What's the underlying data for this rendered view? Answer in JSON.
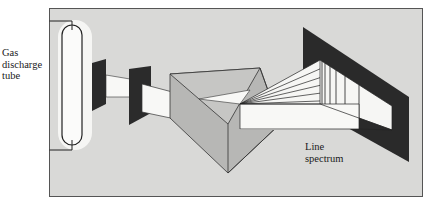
{
  "diagram": {
    "labels": {
      "tube": [
        "Gas",
        "discharge",
        "tube"
      ],
      "spectrum": [
        "Line",
        "spectrum"
      ]
    },
    "components": [
      {
        "id": "gas-discharge-tube",
        "label": "Gas discharge tube"
      },
      {
        "id": "slit-1",
        "label": ""
      },
      {
        "id": "slit-2",
        "label": ""
      },
      {
        "id": "prism",
        "label": ""
      },
      {
        "id": "screen",
        "label": ""
      },
      {
        "id": "line-spectrum",
        "label": "Line spectrum"
      }
    ],
    "colors": {
      "background": "#d9d9d7",
      "frame": "#555555",
      "slit": "#2b2b2b",
      "prism_face": "#b3b3b1",
      "prism_top": "#c4c4c2",
      "beam": "#f8f8f6",
      "screen": "#2a2a2a",
      "line": "#222222"
    }
  }
}
